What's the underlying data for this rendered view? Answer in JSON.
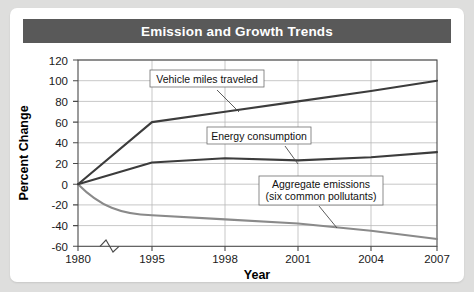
{
  "card": {
    "title": "Emission and Growth Trends"
  },
  "chart_data": {
    "type": "line",
    "title": "Emission and Growth Trends",
    "xlabel": "Year",
    "ylabel": "Percent Change",
    "x": [
      1980,
      1995,
      1998,
      2001,
      2004,
      2007
    ],
    "categories": [
      "1980",
      "1995",
      "1998",
      "2001",
      "2004",
      "2007"
    ],
    "xtick_labels": [
      "1980",
      "1995",
      "1998",
      "2001",
      "2004",
      "2007"
    ],
    "ytick_labels": [
      "120",
      "100",
      "80",
      "60",
      "40",
      "20",
      "0",
      "-20",
      "-40",
      "-60"
    ],
    "ytick_values": [
      120,
      100,
      80,
      60,
      40,
      20,
      0,
      -20,
      -40,
      -60
    ],
    "ylim": [
      -60,
      120
    ],
    "grid": true,
    "legend_position": "inline-annotations",
    "axis_break": {
      "axis": "x",
      "between": [
        "1980",
        "1995"
      ],
      "symbol": "zigzag"
    },
    "series": [
      {
        "name": "Vehicle miles traveled",
        "color": "#3c3c3c",
        "values": [
          0,
          60,
          70,
          80,
          90,
          100
        ]
      },
      {
        "name": "Energy consumption",
        "color": "#3c3c3c",
        "values": [
          0,
          21,
          25,
          23,
          26,
          31
        ]
      },
      {
        "name": "Aggregate emissions (six common pollutants)",
        "color": "#8a8a8a",
        "values": [
          0,
          -30,
          -34,
          -38,
          -45,
          -53
        ]
      }
    ],
    "annotations": [
      {
        "id": "vmt",
        "lines": [
          "Vehicle miles traveled"
        ],
        "target_series": "Vehicle miles traveled"
      },
      {
        "id": "energy",
        "lines": [
          "Energy consumption"
        ],
        "target_series": "Energy consumption"
      },
      {
        "id": "emissions",
        "lines": [
          "Aggregate emissions",
          "(six common pollutants)"
        ],
        "target_series": "Aggregate emissions (six common pollutants)"
      }
    ]
  },
  "colors": {
    "title_bar": "#595959",
    "card": "#ffffff",
    "page": "#dededd",
    "grid": "#b9b9b9",
    "dark_series": "#3c3c3c",
    "light_series": "#8a8a8a"
  }
}
